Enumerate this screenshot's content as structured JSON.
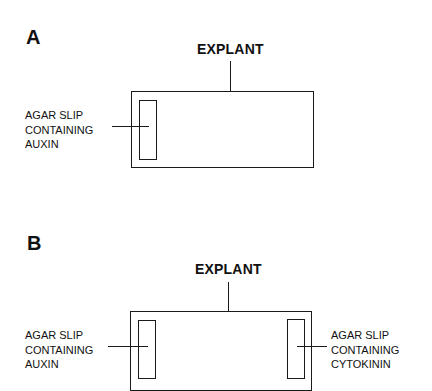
{
  "diagram": {
    "panels": [
      {
        "letter": "A",
        "title": "EXPLANT",
        "left_slip": {
          "label_lines": [
            "AGAR SLIP",
            "CONTAINING",
            "AUXIN"
          ]
        }
      },
      {
        "letter": "B",
        "title": "EXPLANT",
        "left_slip": {
          "label_lines": [
            "AGAR SLIP",
            "CONTAINING",
            "AUXIN"
          ]
        },
        "right_slip": {
          "label_lines": [
            "AGAR SLIP",
            "CONTAINING",
            "CYTOKININ"
          ]
        }
      }
    ]
  },
  "colors": {
    "ink": "#1a1a1a",
    "background": "#ffffff"
  }
}
